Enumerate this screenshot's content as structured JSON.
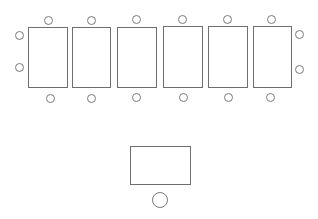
{
  "diagram": {
    "title": "",
    "colors": {
      "stroke": "#6f6f6f",
      "background": "#ffffff"
    },
    "tables": [
      {
        "id": "table-1",
        "x": 28,
        "y": 27,
        "w": 40,
        "h": 61
      },
      {
        "id": "table-2",
        "x": 72,
        "y": 27,
        "w": 39,
        "h": 61
      },
      {
        "id": "table-3",
        "x": 117,
        "y": 27,
        "w": 40,
        "h": 61
      },
      {
        "id": "table-4",
        "x": 163,
        "y": 26,
        "w": 40,
        "h": 62
      },
      {
        "id": "table-5",
        "x": 208,
        "y": 26,
        "w": 40,
        "h": 62
      },
      {
        "id": "table-6",
        "x": 253,
        "y": 26,
        "w": 39,
        "h": 62
      },
      {
        "id": "table-front",
        "x": 130,
        "y": 146,
        "w": 61,
        "h": 39
      }
    ],
    "seats": [
      {
        "id": "seat-top-1",
        "cx": 48,
        "cy": 20,
        "r": 4.5
      },
      {
        "id": "seat-top-2",
        "cx": 91,
        "cy": 20,
        "r": 4.5
      },
      {
        "id": "seat-top-3",
        "cx": 136,
        "cy": 19,
        "r": 4.5
      },
      {
        "id": "seat-top-4",
        "cx": 182,
        "cy": 19,
        "r": 4.5
      },
      {
        "id": "seat-top-5",
        "cx": 227,
        "cy": 19,
        "r": 4.5
      },
      {
        "id": "seat-top-6",
        "cx": 271,
        "cy": 19,
        "r": 4.5
      },
      {
        "id": "seat-left-1",
        "cx": 19,
        "cy": 35,
        "r": 4.5
      },
      {
        "id": "seat-left-2",
        "cx": 19,
        "cy": 67,
        "r": 4.5
      },
      {
        "id": "seat-right-1",
        "cx": 299,
        "cy": 34,
        "r": 4.5
      },
      {
        "id": "seat-right-2",
        "cx": 299,
        "cy": 69,
        "r": 4.5
      },
      {
        "id": "seat-bottom-1",
        "cx": 50,
        "cy": 98,
        "r": 4.5
      },
      {
        "id": "seat-bottom-2",
        "cx": 91,
        "cy": 98,
        "r": 4.5
      },
      {
        "id": "seat-bottom-3",
        "cx": 136,
        "cy": 97,
        "r": 4.5
      },
      {
        "id": "seat-bottom-4",
        "cx": 183,
        "cy": 97,
        "r": 4.5
      },
      {
        "id": "seat-bottom-5",
        "cx": 228,
        "cy": 97,
        "r": 4.5
      },
      {
        "id": "seat-bottom-6",
        "cx": 270,
        "cy": 97,
        "r": 4.5
      },
      {
        "id": "seat-front",
        "cx": 160,
        "cy": 200,
        "r": 8
      }
    ]
  }
}
